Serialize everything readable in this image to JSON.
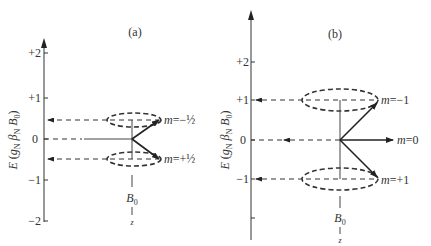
{
  "panels": [
    {
      "id": "a",
      "label": "(a)",
      "y_axis_label": "E (g_N β_N B_0)",
      "y_axis_label_parts": {
        "E": "E",
        "open": " (",
        "g": "g",
        "gsub": "N",
        "beta": " β",
        "bsub": "N",
        "B": " B",
        "Bsub": "0",
        "close": ")"
      },
      "ticks": [
        "+2",
        "+1",
        "0",
        "−1",
        "−2"
      ],
      "states": [
        {
          "m_prefix": "m",
          "m_value": "=−½",
          "energy": -0.5
        },
        {
          "m_prefix": "m",
          "m_value": "=+½",
          "energy": 0.5
        }
      ],
      "field_label": "B",
      "field_sub": "0",
      "field_axis": "z"
    },
    {
      "id": "b",
      "label": "(b)",
      "y_axis_label": "E (g_N β_N B_0)",
      "y_axis_label_parts": {
        "E": "E",
        "open": " (",
        "g": "g",
        "gsub": "N",
        "beta": " β",
        "bsub": "N",
        "B": " B",
        "Bsub": "0",
        "close": ")"
      },
      "ticks": [
        "+2",
        "+1",
        "0",
        "−1"
      ],
      "states": [
        {
          "m_prefix": "m",
          "m_value": "=−1",
          "energy": 1
        },
        {
          "m_prefix": "m",
          "m_value": "=0",
          "energy": 0
        },
        {
          "m_prefix": "m",
          "m_value": "=+1",
          "energy": -1
        }
      ],
      "field_label": "B",
      "field_sub": "0",
      "field_axis": "z"
    }
  ]
}
